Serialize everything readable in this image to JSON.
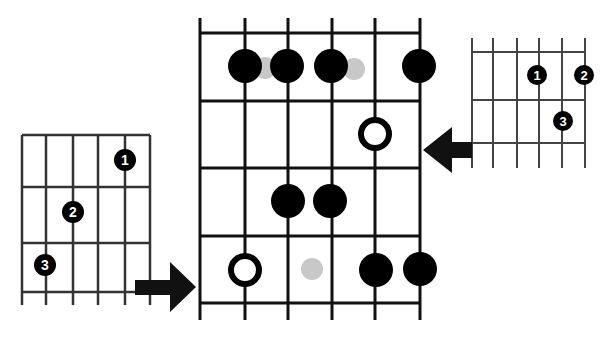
{
  "diagram": {
    "type": "guitar-fretboard-scale-pattern",
    "colors": {
      "line": "#222222",
      "dot": "#000000",
      "ghost_dot": "#c8c8c8",
      "background": "#ffffff"
    },
    "main_grid": {
      "strings": 6,
      "frets": 4,
      "notes": [
        {
          "string": 2,
          "fret": 1,
          "style": "filled"
        },
        {
          "string": 3,
          "fret": 1,
          "style": "filled"
        },
        {
          "string": 4,
          "fret": 1,
          "style": "filled"
        },
        {
          "string": 6,
          "fret": 1,
          "style": "filled"
        },
        {
          "string": 2.5,
          "fret": 1,
          "style": "ghost"
        },
        {
          "string": 4.5,
          "fret": 1,
          "style": "ghost"
        },
        {
          "string": 5,
          "fret": 2,
          "style": "root-open"
        },
        {
          "string": 3,
          "fret": 3,
          "style": "filled"
        },
        {
          "string": 4,
          "fret": 3,
          "style": "filled"
        },
        {
          "string": 2,
          "fret": 4,
          "style": "root-open"
        },
        {
          "string": 3.5,
          "fret": 4,
          "style": "ghost"
        },
        {
          "string": 5,
          "fret": 4,
          "style": "filled"
        },
        {
          "string": 6,
          "fret": 4,
          "style": "filled"
        }
      ]
    },
    "left_grid": {
      "strings": 6,
      "frets": 3,
      "fingers": [
        {
          "label": "1",
          "string": 5,
          "fret": 1
        },
        {
          "label": "2",
          "string": 3,
          "fret": 2
        },
        {
          "label": "3",
          "string": 2,
          "fret": 3
        }
      ],
      "arrow_direction": "right"
    },
    "right_grid": {
      "strings": 6,
      "frets": 2,
      "fingers": [
        {
          "label": "1",
          "string": 4,
          "fret": 1
        },
        {
          "label": "2",
          "string": 6,
          "fret": 1
        },
        {
          "label": "3",
          "string": 5,
          "fret": 2
        }
      ],
      "arrow_direction": "left"
    }
  }
}
